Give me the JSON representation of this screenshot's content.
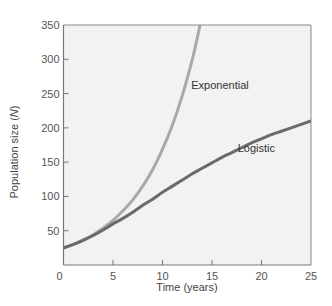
{
  "chart_data": {
    "type": "line",
    "title": "",
    "xlabel": "Time (years)",
    "ylabel_prefix": "Population size (",
    "ylabel_var": "N",
    "ylabel_suffix": ")",
    "xlim": [
      0,
      25
    ],
    "ylim": [
      0,
      350
    ],
    "x_ticks": [
      0,
      5,
      10,
      15,
      20,
      25
    ],
    "y_ticks": [
      50,
      100,
      150,
      200,
      250,
      300,
      350
    ],
    "grid": false,
    "legend": "inline labels",
    "series": [
      {
        "name": "Exponential",
        "color": "#a9a9a9",
        "x": [
          0,
          1,
          2,
          3,
          4,
          5,
          6,
          7,
          8,
          9,
          10,
          11,
          12,
          13,
          13.8
        ],
        "values": [
          25,
          30,
          37,
          44,
          54,
          65,
          79,
          95,
          115,
          139,
          169,
          204,
          247,
          299,
          350
        ],
        "label_pos": [
          12.9,
          257
        ]
      },
      {
        "name": "Logistic",
        "color": "#6a6a6a",
        "x": [
          0,
          1,
          2,
          3,
          4,
          5,
          6,
          7,
          8,
          9,
          10,
          11,
          12,
          13,
          14,
          15,
          16,
          17,
          18,
          19,
          20,
          21,
          22,
          23,
          24,
          25
        ],
        "values": [
          25,
          30,
          36,
          43,
          51,
          60,
          68,
          77,
          87,
          96,
          106,
          115,
          124,
          133,
          141,
          149,
          157,
          164,
          171,
          178,
          184,
          190,
          195,
          200,
          205,
          210
        ],
        "label_pos": [
          17.6,
          165
        ]
      }
    ]
  }
}
